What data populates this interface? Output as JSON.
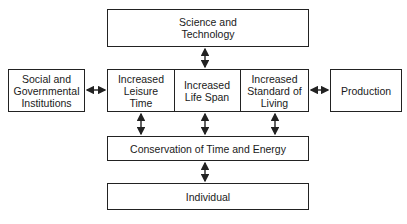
{
  "diagram": {
    "nodes": {
      "science": {
        "label": "Science and\nTechnology"
      },
      "social": {
        "label": "Social and\nGovernmental\nInstitutions"
      },
      "leisure": {
        "label": "Increased\nLeisure\nTime"
      },
      "lifespan": {
        "label": "Increased\nLife Span"
      },
      "standard": {
        "label": "Increased\nStandard of\nLiving"
      },
      "production": {
        "label": "Production"
      },
      "conservation": {
        "label": "Conservation of Time and Energy"
      },
      "individual": {
        "label": "Individual"
      }
    },
    "edges": [
      {
        "from": "science",
        "to": "lifespan",
        "type": "bidirectional"
      },
      {
        "from": "social",
        "to": "leisure",
        "type": "bidirectional"
      },
      {
        "from": "standard",
        "to": "production",
        "type": "bidirectional"
      },
      {
        "from": "leisure",
        "to": "conservation",
        "type": "bidirectional"
      },
      {
        "from": "lifespan",
        "to": "conservation",
        "type": "bidirectional"
      },
      {
        "from": "standard",
        "to": "conservation",
        "type": "bidirectional"
      },
      {
        "from": "conservation",
        "to": "individual",
        "type": "bidirectional"
      }
    ]
  }
}
